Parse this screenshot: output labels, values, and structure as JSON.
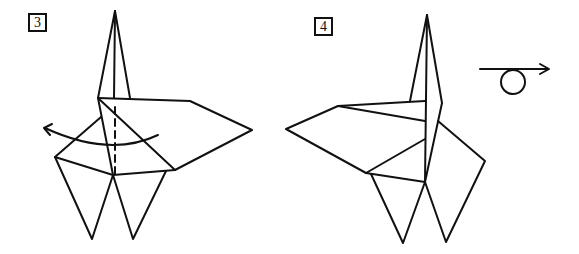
{
  "steps": [
    {
      "number": "3",
      "description": "Fold the left flap over along the valley fold line (dashed), arrow indicating fold direction to the left"
    },
    {
      "number": "4",
      "description": "Result of fold; turn the model over"
    }
  ],
  "symbols": {
    "valley_fold": "dashed-line",
    "fold_arrow": "curved-arrow-left",
    "turn_over": "turn-over-symbol"
  },
  "colors": {
    "line": "#111111",
    "background": "#ffffff"
  }
}
